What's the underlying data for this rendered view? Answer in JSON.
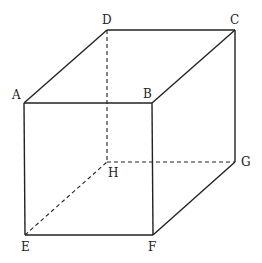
{
  "diagram": {
    "type": "cube",
    "vertices": {
      "A": {
        "label": "A",
        "x": 24,
        "y": 103
      },
      "B": {
        "label": "B",
        "x": 152,
        "y": 103
      },
      "C": {
        "label": "C",
        "x": 235,
        "y": 30
      },
      "D": {
        "label": "D",
        "x": 107,
        "y": 30
      },
      "E": {
        "label": "E",
        "x": 25,
        "y": 235
      },
      "F": {
        "label": "F",
        "x": 153,
        "y": 235
      },
      "G": {
        "label": "G",
        "x": 235,
        "y": 162
      },
      "H": {
        "label": "H",
        "x": 107,
        "y": 162
      }
    },
    "solid_edges": [
      "AB",
      "BC",
      "CD",
      "DA",
      "AE",
      "BF",
      "CG",
      "EF",
      "FG"
    ],
    "hidden_edges": [
      "DH",
      "EH",
      "HG"
    ],
    "line_color": "#222222"
  }
}
